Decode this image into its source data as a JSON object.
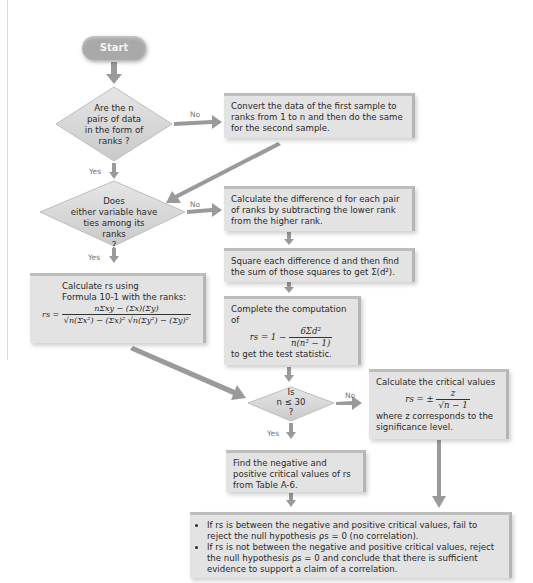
{
  "start": {
    "label": "Start"
  },
  "labels": {
    "yes": "Yes",
    "no": "No"
  },
  "decisions": {
    "ranks_form": [
      "Are the n",
      "pairs of data",
      "in the form of",
      "ranks ?"
    ],
    "ties": [
      "Does",
      "either variable have",
      "ties among its",
      "ranks",
      "?"
    ],
    "n_small": [
      "Is",
      "n ≤ 30",
      "?"
    ]
  },
  "boxes": {
    "convert": "Convert the data of the first sample to ranks from 1 to n and then do the same for the second sample.",
    "difference": "Calculate the difference d for each pair of ranks by subtracting the lower rank from the higher rank.",
    "square": "Square each difference d and then find the sum of those squares to get Σ(d²).",
    "complete": {
      "intro": "Complete the computation of",
      "lhs": "rs = 1 −",
      "num": "6Σd²",
      "den": "n(n² − 1)",
      "outro": "to get the test statistic."
    },
    "pearson": {
      "line1": "Calculate rs using",
      "line2": "Formula 10-1 with the ranks:",
      "lhs": "rs =",
      "num": "nΣxy − (Σx)(Σy)",
      "den": "√n(Σx²) − (Σx)²  √n(Σy²) − (Σy)²"
    },
    "critical_large": {
      "intro": "Calculate the critical values",
      "lhs": "rs = ±",
      "num": "z",
      "den": "√n − 1",
      "outro": "where z corresponds to the significance level."
    },
    "table": "Find the negative and positive critical values of rs from Table A-6.",
    "conclusion": [
      "If rs is between the negative and positive critical values, fail to reject the null hypothesis ρs = 0 (no correlation).",
      "If rs is not between the negative and positive critical values, reject the null hypothesis ρs = 0 and conclude that there is sufficient evidence to support a claim of a correlation."
    ]
  },
  "colors": {
    "box": "#e3e3e3",
    "arrow": "#9a9a9a",
    "start": "#a9a9a9"
  }
}
